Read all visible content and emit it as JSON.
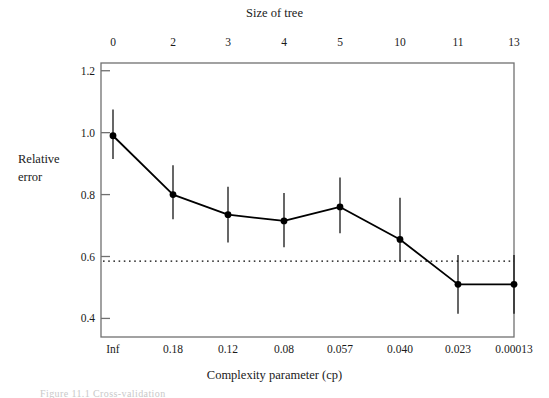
{
  "chart_data": {
    "type": "line",
    "title": "",
    "xlabel": "Complexity parameter (cp)",
    "ylabel": "Relative error",
    "top_axis_label": "Size of tree",
    "categories": [
      "Inf",
      "0.18",
      "0.12",
      "0.08",
      "0.057",
      "0.040",
      "0.023",
      "0.00013"
    ],
    "top_tick_labels": [
      "0",
      "2",
      "3",
      "4",
      "5",
      "10",
      "11",
      "13"
    ],
    "x_positions": [
      113,
      173,
      228,
      284,
      340,
      400,
      458,
      514
    ],
    "values": [
      0.99,
      0.8,
      0.735,
      0.715,
      0.76,
      0.655,
      0.51,
      0.51
    ],
    "error_low": [
      0.915,
      0.72,
      0.645,
      0.63,
      0.675,
      0.585,
      0.415,
      0.415
    ],
    "error_high": [
      1.075,
      0.895,
      0.825,
      0.805,
      0.855,
      0.79,
      0.605,
      0.605
    ],
    "ylim": [
      0.34,
      1.225
    ],
    "y_ticks": [
      0.4,
      0.6,
      0.8,
      1.0,
      1.2
    ],
    "y_tick_labels": [
      "0.4",
      "0.6",
      "0.8",
      "1.0",
      "1.2"
    ],
    "reference_line": {
      "value": 0.585,
      "style": "dotted",
      "orientation": "horizontal"
    },
    "grid": false,
    "legend": "none",
    "series_name": "xerror",
    "marker": "filled-circle",
    "errorbar_style": "plain-vertical-no-caps",
    "line_color": "#000000",
    "box_color": "#707070"
  },
  "figure": {
    "plot_box": {
      "left": 101,
      "top": 63,
      "right": 514,
      "bottom": 337
    },
    "caption": "Figure 11.1   Cross-validation"
  }
}
